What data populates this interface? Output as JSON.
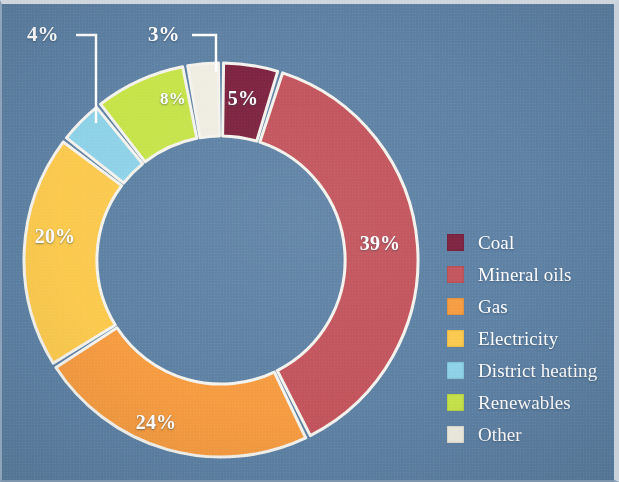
{
  "figure": {
    "background_color": "#5e81a4",
    "label_text_color": "#ffffff",
    "separator_color": "#f4f2ec"
  },
  "chart_data": {
    "type": "pie",
    "variant": "donut",
    "title": "",
    "subtitle": "",
    "xlabel": "",
    "ylabel": "",
    "legend_position": "right",
    "grid": false,
    "start_angle_deg": 0,
    "direction": "clockwise",
    "inner_radius_ratio": 0.63,
    "value_unit": "%",
    "categories": [
      "Coal",
      "Mineral oils",
      "Gas",
      "Electricity",
      "District heating",
      "Renewables",
      "Other"
    ],
    "values": [
      5,
      39,
      24,
      20,
      4,
      8,
      3
    ],
    "labels": [
      "5%",
      "39%",
      "24%",
      "20%",
      "4%",
      "8%",
      "3%"
    ],
    "colors": [
      "#7c2340",
      "#c2545c",
      "#f59b42",
      "#fbc94e",
      "#8ed2e8",
      "#c6e34a",
      "#efece1"
    ],
    "label_placement": [
      "inside",
      "inside",
      "inside",
      "inside",
      "callout",
      "inside",
      "callout"
    ],
    "slices": [
      {
        "name": "Coal",
        "value": 5,
        "label": "5%",
        "color": "#7c2340",
        "placement": "inside"
      },
      {
        "name": "Mineral oils",
        "value": 39,
        "label": "39%",
        "color": "#c2545c",
        "placement": "inside"
      },
      {
        "name": "Gas",
        "value": 24,
        "label": "24%",
        "color": "#f59b42",
        "placement": "inside"
      },
      {
        "name": "Electricity",
        "value": 20,
        "label": "20%",
        "color": "#fbc94e",
        "placement": "inside"
      },
      {
        "name": "District heating",
        "value": 4,
        "label": "4%",
        "color": "#8ed2e8",
        "placement": "callout"
      },
      {
        "name": "Renewables",
        "value": 8,
        "label": "8%",
        "color": "#c6e34a",
        "placement": "inside"
      },
      {
        "name": "Other",
        "value": 3,
        "label": "3%",
        "color": "#efece1",
        "placement": "callout"
      }
    ]
  },
  "slice_labels": {
    "coal": "5%",
    "mineral_oils": "39%",
    "gas": "24%",
    "electricity": "20%",
    "renewables": "8%"
  },
  "callouts": {
    "district_heating": "4%",
    "other": "3%"
  },
  "legend": {
    "items": [
      {
        "label": "Coal",
        "color": "#7c2340"
      },
      {
        "label": "Mineral oils",
        "color": "#c2545c"
      },
      {
        "label": "Gas",
        "color": "#f59b42"
      },
      {
        "label": "Electricity",
        "color": "#fbc94e"
      },
      {
        "label": "District heating",
        "color": "#8ed2e8"
      },
      {
        "label": "Renewables",
        "color": "#c6e34a"
      },
      {
        "label": "Other",
        "color": "#efece1"
      }
    ]
  }
}
